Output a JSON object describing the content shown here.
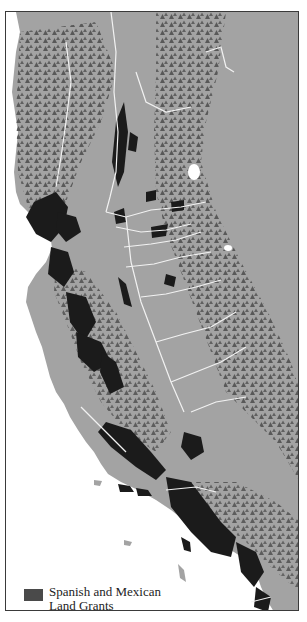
{
  "map": {
    "title": "Spanish and Mexican Land Grants",
    "region": "California coast and Central Valley",
    "colors": {
      "land": "#a3a3a3",
      "water": "#ffffff",
      "land_grants": "#1b1b1b",
      "mountains": "#555555",
      "rivers": "#f2f2f2",
      "frame": "#3a3a3a"
    }
  },
  "legend": {
    "items": [
      {
        "label_line1": "Spanish and Mexican",
        "label_line2": "Land Grants",
        "color": "#4a4a4a"
      }
    ]
  }
}
